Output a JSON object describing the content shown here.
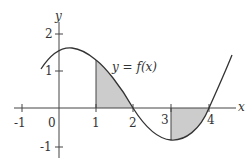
{
  "diagram": {
    "title": "",
    "curve_label": "y = f(x)",
    "axes": {
      "x_label": "x",
      "y_label": "y",
      "x_ticks": [
        "-1",
        "0",
        "1",
        "2",
        "3",
        "4"
      ],
      "y_ticks": [
        "2",
        "1",
        "-1"
      ]
    },
    "shaded_regions": [
      {
        "from": 1,
        "to": 2,
        "side": "above x-axis"
      },
      {
        "from": 3,
        "to": 4,
        "side": "below x-axis"
      }
    ],
    "colors": {
      "curve": "#333333",
      "axes": "#444444",
      "shade": "#cccccc"
    }
  }
}
